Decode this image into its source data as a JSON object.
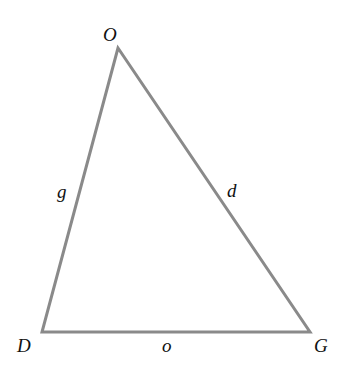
{
  "diagram": {
    "type": "triangle",
    "stroke_color": "#8a8a8a",
    "label_color": "#111111",
    "vertices": [
      {
        "id": "O",
        "label": "O",
        "x": 118,
        "y": 48
      },
      {
        "id": "D",
        "label": "D",
        "x": 42,
        "y": 332
      },
      {
        "id": "G",
        "label": "G",
        "x": 310,
        "y": 332
      }
    ],
    "sides": [
      {
        "id": "g",
        "label": "g",
        "from": "D",
        "to": "O"
      },
      {
        "id": "d",
        "label": "d",
        "from": "O",
        "to": "G"
      },
      {
        "id": "o",
        "label": "o",
        "from": "D",
        "to": "G"
      }
    ]
  }
}
